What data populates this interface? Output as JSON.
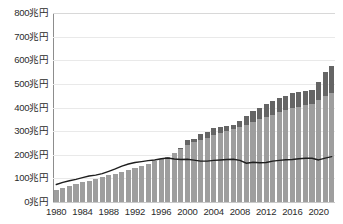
{
  "chart_data": {
    "type": "bar",
    "title": "",
    "subtitle": "",
    "xlabel": "",
    "ylabel": "",
    "ylim": [
      0,
      800
    ],
    "ytick_values": [
      0,
      100,
      200,
      300,
      400,
      500,
      600,
      700,
      800
    ],
    "ytick_labels": [
      "0兆円",
      "100兆円",
      "200兆円",
      "300兆円",
      "400兆円",
      "500兆円",
      "600兆円",
      "700兆円",
      "800兆円"
    ],
    "y_unit": "兆円",
    "grid": true,
    "legend": "none",
    "xtick_labels": [
      "1980",
      "1984",
      "1988",
      "1992",
      "1996",
      "2000",
      "2004",
      "2008",
      "2012",
      "2016",
      "2020"
    ],
    "xtick_years": [
      1980,
      1984,
      1988,
      1992,
      1996,
      2000,
      2004,
      2008,
      2012,
      2016,
      2020
    ],
    "categories": [
      1980,
      1981,
      1982,
      1983,
      1984,
      1985,
      1986,
      1987,
      1988,
      1989,
      1990,
      1991,
      1992,
      1993,
      1994,
      1995,
      1996,
      1997,
      1998,
      1999,
      2000,
      2001,
      2002,
      2003,
      2004,
      2005,
      2006,
      2007,
      2008,
      2009,
      2010,
      2011,
      2012,
      2013,
      2014,
      2015,
      2016,
      2017,
      2018,
      2019,
      2020,
      2021,
      2022
    ],
    "series": [
      {
        "name": "bar-lower-segment",
        "type": "bar",
        "color": "#9e9e9e",
        "values": [
          50,
          59,
          68,
          76,
          84,
          91,
          98,
          106,
          113,
          120,
          128,
          136,
          143,
          152,
          162,
          173,
          184,
          191,
          208,
          226,
          241,
          252,
          264,
          273,
          283,
          293,
          300,
          307,
          316,
          327,
          340,
          350,
          360,
          370,
          380,
          388,
          397,
          403,
          409,
          413,
          430,
          450,
          462
        ],
        "label": "",
        "note": "light-grey lower portion of each bar"
      },
      {
        "name": "bar-upper-segment",
        "type": "bar",
        "color": "#656565",
        "values": [
          0,
          0,
          0,
          0,
          0,
          0,
          0,
          0,
          0,
          0,
          0,
          0,
          0,
          0,
          0,
          0,
          0,
          0,
          0,
          4,
          20,
          16,
          26,
          24,
          30,
          26,
          22,
          20,
          26,
          38,
          46,
          50,
          54,
          58,
          60,
          62,
          64,
          63,
          62,
          61,
          80,
          100,
          113
        ],
        "label": "",
        "note": "dark-grey upper portion of each bar (stacked on top of lower segment)"
      },
      {
        "name": "bar-total",
        "type": "bar-total",
        "color": "#8b8b8b",
        "values": [
          50,
          59,
          68,
          76,
          84,
          91,
          98,
          106,
          113,
          120,
          128,
          136,
          143,
          152,
          162,
          173,
          184,
          191,
          208,
          230,
          261,
          268,
          290,
          297,
          313,
          319,
          322,
          327,
          342,
          365,
          386,
          400,
          414,
          428,
          440,
          450,
          461,
          466,
          471,
          474,
          510,
          550,
          575
        ],
        "label": ""
      },
      {
        "name": "line-overlay",
        "type": "line",
        "color": "#1f1f1f",
        "values": [
          74,
          83,
          90,
          96,
          103,
          110,
          114,
          120,
          130,
          140,
          152,
          161,
          167,
          171,
          175,
          178,
          183,
          186,
          182,
          180,
          181,
          177,
          173,
          173,
          176,
          178,
          180,
          181,
          176,
          164,
          168,
          166,
          167,
          173,
          176,
          179,
          180,
          183,
          185,
          185,
          178,
          186,
          192
        ],
        "label": ""
      }
    ]
  },
  "axis": {
    "y_label_0": "0兆円",
    "y_label_100": "100兆円",
    "y_label_200": "200兆円",
    "y_label_300": "300兆円",
    "y_label_400": "400兆円",
    "y_label_500": "500兆円",
    "y_label_600": "600兆円",
    "y_label_700": "700兆円",
    "y_label_800": "800兆円"
  }
}
